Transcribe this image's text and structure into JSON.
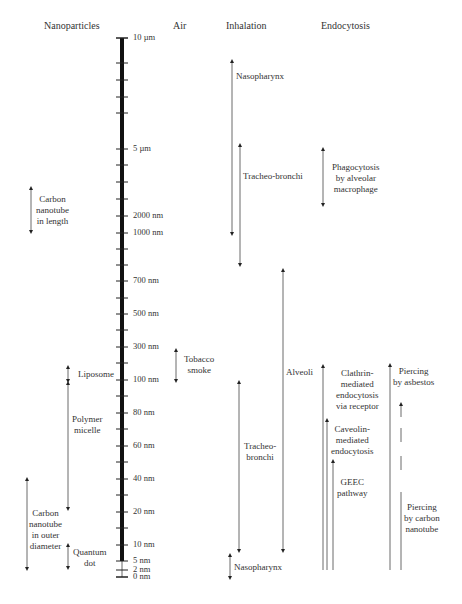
{
  "headers": {
    "nanoparticles": "Nanoparticles",
    "air": "Air",
    "inhalation": "Inhalation",
    "endocytosis": "Endocytosis"
  },
  "scale": {
    "ticks": [
      {
        "label": "10 µm",
        "y": 38
      },
      {
        "label": "5 µm",
        "y": 149
      },
      {
        "label": "2000 nm",
        "y": 216
      },
      {
        "label": "1000 nm",
        "y": 233
      },
      {
        "label": "700 nm",
        "y": 281
      },
      {
        "label": "500 nm",
        "y": 314
      },
      {
        "label": "300 nm",
        "y": 347
      },
      {
        "label": "100 nm",
        "y": 380
      },
      {
        "label": "80 nm",
        "y": 413
      },
      {
        "label": "60 nm",
        "y": 446
      },
      {
        "label": "40 nm",
        "y": 479
      },
      {
        "label": "20 nm",
        "y": 512
      },
      {
        "label": "10 nm",
        "y": 545
      },
      {
        "label": "5 nm",
        "y": 561
      },
      {
        "label": "2 nm",
        "y": 570
      },
      {
        "label": "0 nm",
        "y": 577
      }
    ],
    "minor_ticks_y": [
      63,
      80,
      97,
      113,
      165,
      182,
      199,
      249,
      265,
      298,
      330,
      363,
      396,
      429,
      462,
      495,
      528
    ]
  },
  "nanoparticles": {
    "carbon_nanotube_length": "Carbon\nnanotube\nin length",
    "liposome": "Liposome",
    "polymer_micelle": "Polymer\nmicelle",
    "carbon_nanotube_diameter": "Carbon\nnanotube\nin outer\ndiameter",
    "quantum_dot": "Quantum\ndot"
  },
  "air": {
    "tobacco_smoke": "Tobacco\nsmoke"
  },
  "inhalation": {
    "nasopharynx_top": "Nasopharynx",
    "tracheo_bronchi_top": "Tracheo-bronchi",
    "alveoli": "Alveoli",
    "tracheo_bronchi_bottom": "Tracheo-\nbronchi",
    "nasopharynx_bottom": "Nasopharynx"
  },
  "endocytosis": {
    "phagocytosis": "Phagocytosis\nby alveolar\nmacrophage",
    "clathrin": "Clathrin-\nmediated\nendocytosis\nvia receptor",
    "caveolin": "Caveolin-\nmediated\nendocytosis",
    "geec": "GEEC\npathway",
    "piercing_asbestos": "Piercing\nby asbestos",
    "piercing_carbon_nanotube": "Piercing\nby carbon\nnanotube"
  }
}
